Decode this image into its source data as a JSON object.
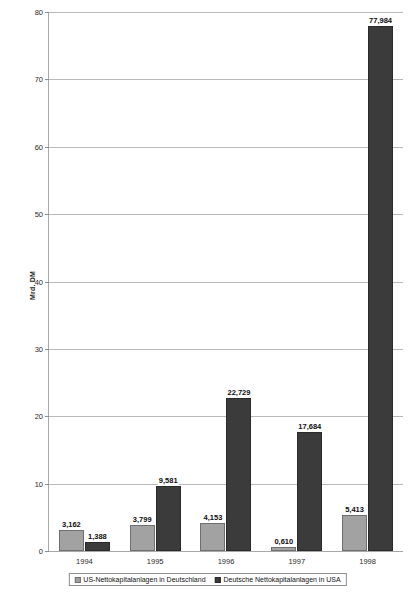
{
  "chart_data": {
    "type": "bar",
    "title": "",
    "subtitle": "",
    "xlabel": "",
    "ylabel": "Mrd. DM",
    "ylim": [
      0,
      80
    ],
    "ytick_step": 10,
    "ytick_labels": [
      "0",
      "10",
      "20",
      "30",
      "40",
      "50",
      "60",
      "70",
      "80"
    ],
    "grid": true,
    "legend_position": "bottom",
    "categories": [
      "1994",
      "1995",
      "1996",
      "1997",
      "1998"
    ],
    "series": [
      {
        "name": "US-Nettokapitalanlagen in Deutschland",
        "color": "#a2a2a2",
        "values": [
          3.162,
          3.799,
          4.153,
          0.61,
          5.413
        ],
        "labels": [
          "3,162",
          "3,799",
          "4,153",
          "0,610",
          "5,413"
        ]
      },
      {
        "name": "Deutsche Nettokapitalanlagen in USA",
        "color": "#3b3b3b",
        "values": [
          1.388,
          9.581,
          22.729,
          17.684,
          77.984
        ],
        "labels": [
          "1,388",
          "9,581",
          "22,729",
          "17,684",
          "77,984"
        ]
      }
    ]
  },
  "legend": {
    "items": [
      {
        "label": "US-Nettokapitalanlagen in Deutschland"
      },
      {
        "label": "Deutsche Nettokapitalanlagen in USA"
      }
    ]
  },
  "axis": {
    "y_title": "Mrd. DM"
  }
}
